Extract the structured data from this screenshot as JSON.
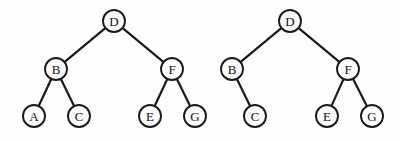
{
  "figure": {
    "background_color": "#fefefe",
    "stroke_color": "#1a1a1a",
    "node_fill_color": "#fdfdfd",
    "node_radius": 11,
    "width": 401,
    "height": 141
  },
  "chart_data": {
    "type": "diagram",
    "subtype": "binary-tree",
    "count": 2,
    "trees": [
      {
        "name": "left-tree",
        "root": "D",
        "nodes": [
          {
            "id": "D",
            "label": "D",
            "x": 114,
            "y": 21,
            "depth": 0
          },
          {
            "id": "B",
            "label": "B",
            "x": 56,
            "y": 69,
            "depth": 1
          },
          {
            "id": "F",
            "label": "F",
            "x": 172,
            "y": 69,
            "depth": 1
          },
          {
            "id": "A",
            "label": "A",
            "x": 34,
            "y": 116,
            "depth": 2
          },
          {
            "id": "C",
            "label": "C",
            "x": 79,
            "y": 116,
            "depth": 2
          },
          {
            "id": "E",
            "label": "E",
            "x": 150,
            "y": 116,
            "depth": 2
          },
          {
            "id": "G",
            "label": "G",
            "x": 195,
            "y": 116,
            "depth": 2
          }
        ],
        "edges": [
          {
            "from": "D",
            "to": "B",
            "side": "left"
          },
          {
            "from": "D",
            "to": "F",
            "side": "right"
          },
          {
            "from": "B",
            "to": "A",
            "side": "left"
          },
          {
            "from": "B",
            "to": "C",
            "side": "right"
          },
          {
            "from": "F",
            "to": "E",
            "side": "left"
          },
          {
            "from": "F",
            "to": "G",
            "side": "right"
          }
        ],
        "inorder": "A B C D E F G"
      },
      {
        "name": "right-tree",
        "root": "D",
        "nodes": [
          {
            "id": "D",
            "label": "D",
            "x": 290,
            "y": 21,
            "depth": 0
          },
          {
            "id": "B",
            "label": "B",
            "x": 232,
            "y": 69,
            "depth": 1
          },
          {
            "id": "F",
            "label": "F",
            "x": 348,
            "y": 69,
            "depth": 1
          },
          {
            "id": "C",
            "label": "C",
            "x": 255,
            "y": 116,
            "depth": 2
          },
          {
            "id": "E",
            "label": "E",
            "x": 327,
            "y": 116,
            "depth": 2
          },
          {
            "id": "G",
            "label": "G",
            "x": 372,
            "y": 116,
            "depth": 2
          }
        ],
        "edges": [
          {
            "from": "D",
            "to": "B",
            "side": "left"
          },
          {
            "from": "D",
            "to": "F",
            "side": "right"
          },
          {
            "from": "B",
            "to": "C",
            "side": "right"
          },
          {
            "from": "F",
            "to": "E",
            "side": "left"
          },
          {
            "from": "F",
            "to": "G",
            "side": "right"
          }
        ],
        "inorder": "B C D E F G"
      }
    ]
  }
}
